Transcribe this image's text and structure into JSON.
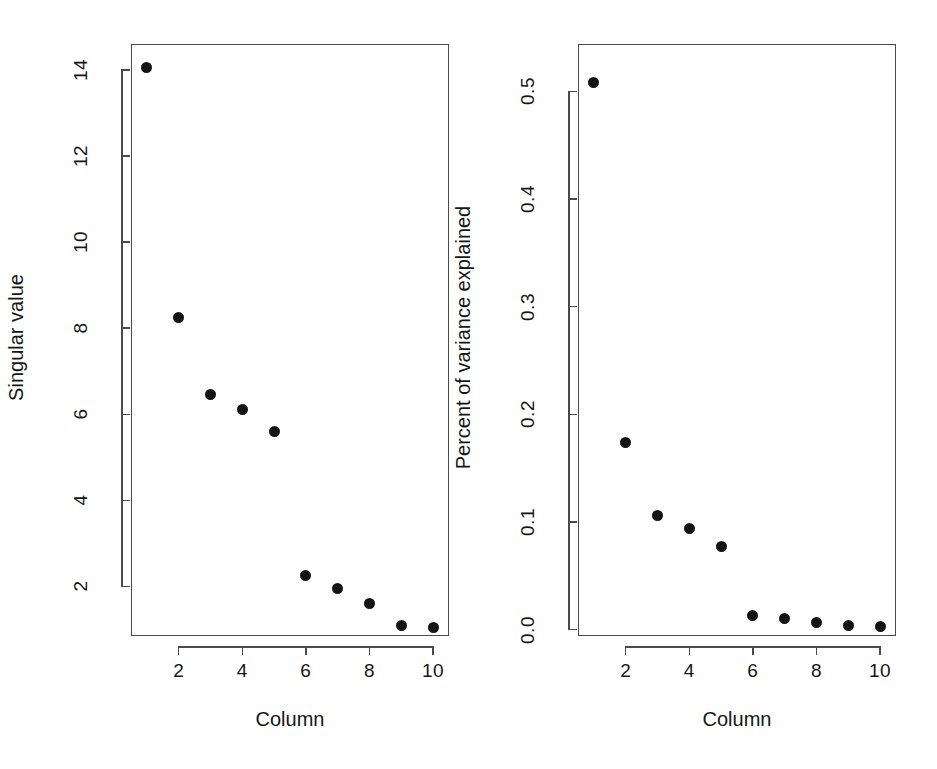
{
  "figure": {
    "background": "#ffffff",
    "point_color": "#141414",
    "axis_color": "#4a4a4a",
    "width": 937,
    "height": 769,
    "panels": 2
  },
  "chart_data": [
    {
      "type": "scatter",
      "title": "",
      "xlabel": "Column",
      "ylabel": "Singular value",
      "x": [
        1,
        2,
        3,
        4,
        5,
        6,
        7,
        8,
        9,
        10
      ],
      "values": [
        14.05,
        8.25,
        6.45,
        6.1,
        5.6,
        2.25,
        1.95,
        1.6,
        1.1,
        1.05
      ],
      "xlim": [
        0.5,
        10.5
      ],
      "ylim": [
        0.85,
        14.6
      ],
      "xticks": [
        2,
        4,
        6,
        8,
        10
      ],
      "xticklabels": [
        "2",
        "4",
        "6",
        "8",
        "10"
      ],
      "yticks": [
        2,
        4,
        6,
        8,
        10,
        12,
        14
      ],
      "yticklabels": [
        "2",
        "4",
        "6",
        "8",
        "10",
        "12",
        "14"
      ],
      "grid": false,
      "legend": false,
      "marker": "filled-circle"
    },
    {
      "type": "scatter",
      "title": "",
      "xlabel": "Column",
      "ylabel": "Percent of variance explained",
      "x": [
        1,
        2,
        3,
        4,
        5,
        6,
        7,
        8,
        9,
        10
      ],
      "values": [
        0.508,
        0.174,
        0.106,
        0.094,
        0.077,
        0.013,
        0.01,
        0.007,
        0.004,
        0.003
      ],
      "xlim": [
        0.5,
        10.5
      ],
      "ylim": [
        -0.006,
        0.544
      ],
      "xticks": [
        2,
        4,
        6,
        8,
        10
      ],
      "xticklabels": [
        "2",
        "4",
        "6",
        "8",
        "10"
      ],
      "yticks": [
        0.0,
        0.1,
        0.2,
        0.3,
        0.4,
        0.5
      ],
      "yticklabels": [
        "0.0",
        "0.1",
        "0.2",
        "0.3",
        "0.4",
        "0.5"
      ],
      "grid": false,
      "legend": false,
      "marker": "filled-circle"
    }
  ]
}
